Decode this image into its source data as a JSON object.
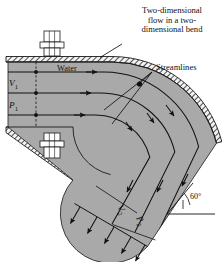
{
  "figure": {
    "name": "two-dimensional-pipe-bend",
    "background": "#ffffff",
    "fluid_color": "#a9a9a9",
    "wall_color": "#ffffff",
    "line_color": "#1a1a1a"
  },
  "callouts": {
    "title_line1": "Two-dimensional",
    "title_line2": "flow in a two-",
    "title_line3": "dimensional bend",
    "streamlines": "Streamlines"
  },
  "labels": {
    "water": "Water",
    "inlet_velocity": "V",
    "inlet_velocity_sub": "1",
    "inlet_pressure": "P",
    "inlet_pressure_sub": "1",
    "outlet_velocity": "V",
    "outlet_velocity_sub": "2",
    "outlet_pressure": "P",
    "outlet_pressure_sub": "2",
    "angle": "60°"
  },
  "geometry": {
    "bend_angle_deg": 60,
    "streamline_count": 3,
    "inlet_arrow_count": 3,
    "outlet_arrow_count": 5,
    "bolt_count": 2
  }
}
